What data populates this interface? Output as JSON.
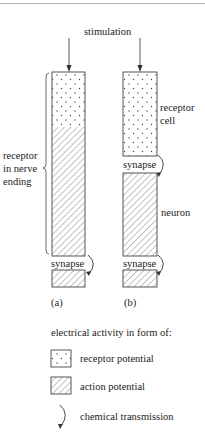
{
  "diagram": {
    "title_label": "stimulation",
    "colors": {
      "ink": "#333333",
      "rule": "#b5b5b5",
      "background": "#ffffff"
    },
    "panels": [
      {
        "id": "a",
        "caption": "(a)",
        "side_label": [
          "receptor",
          "in nerve",
          "ending"
        ],
        "segments": [
          {
            "type": "receptor-potential",
            "pattern": "dots"
          },
          {
            "type": "action-potential",
            "pattern": "hatch"
          }
        ],
        "synapse_label": "synapse"
      },
      {
        "id": "b",
        "caption": "(b)",
        "receptor_cell_label": [
          "receptor",
          "cell"
        ],
        "upper_synapse_label": "synapse",
        "neuron_label": "neuron",
        "lower_synapse_label": "synapse"
      }
    ],
    "legend": {
      "heading": "electrical activity in form of:",
      "items": [
        {
          "icon": "dotted-box-icon",
          "label": "receptor potential"
        },
        {
          "icon": "hatched-box-icon",
          "label": "action potential"
        },
        {
          "icon": "curved-arrow-icon",
          "label": "chemical transmission"
        }
      ]
    }
  }
}
